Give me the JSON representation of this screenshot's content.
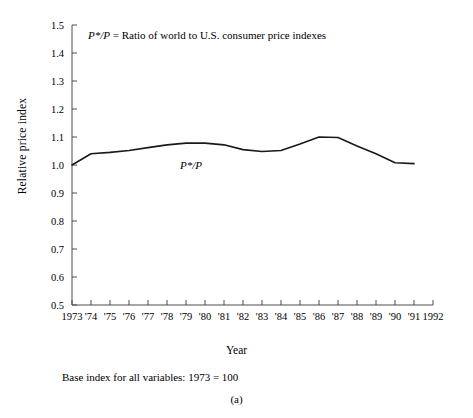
{
  "figure": {
    "panel_id": "(a)",
    "base_note": "Base index for all variables: 1973 = 100",
    "annotation": "P*/P = Ratio of world to U.S. consumer price indexes",
    "series_label": "P*/P"
  },
  "chart_data": {
    "type": "line",
    "title": "",
    "xlabel": "Year",
    "ylabel": "Relative price index",
    "xlim": [
      1973,
      1992
    ],
    "ylim": [
      0.5,
      1.5
    ],
    "grid": false,
    "legend_position": "inline-annotation",
    "ytick_labels": [
      "0.5",
      "0.6",
      "0.7",
      "0.8",
      "0.9",
      "1.0",
      "1.1",
      "1.2",
      "1.3",
      "1.4",
      "1.5"
    ],
    "ytick_values": [
      0.5,
      0.6,
      0.7,
      0.8,
      0.9,
      1.0,
      1.1,
      1.2,
      1.3,
      1.4,
      1.5
    ],
    "xtick_labels": [
      "1973",
      "'74",
      "'75",
      "'76",
      "'77",
      "'78",
      "'79",
      "'80",
      "'81",
      "'82",
      "'83",
      "'84",
      "'85",
      "'86",
      "'87",
      "'88",
      "'89",
      "'90",
      "'91",
      "1992"
    ],
    "xtick_values": [
      1973,
      1974,
      1975,
      1976,
      1977,
      1978,
      1979,
      1980,
      1981,
      1982,
      1983,
      1984,
      1985,
      1986,
      1987,
      1988,
      1989,
      1990,
      1991,
      1992
    ],
    "series": [
      {
        "name": "P*/P",
        "color": "#1a1a1a",
        "x": [
          1973,
          1974,
          1975,
          1976,
          1977,
          1978,
          1979,
          1980,
          1981,
          1982,
          1983,
          1984,
          1985,
          1986,
          1987,
          1988,
          1989,
          1990,
          1991
        ],
        "values": [
          1.0,
          1.04,
          1.045,
          1.052,
          1.062,
          1.072,
          1.078,
          1.078,
          1.072,
          1.055,
          1.048,
          1.052,
          1.075,
          1.1,
          1.098,
          1.068,
          1.04,
          1.008,
          1.005
        ]
      }
    ]
  }
}
